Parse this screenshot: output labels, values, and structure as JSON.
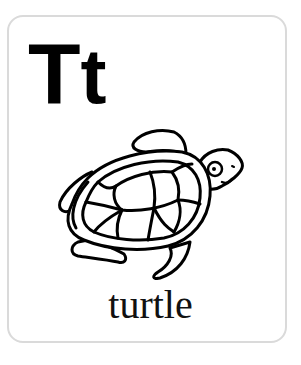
{
  "card": {
    "letters": {
      "uppercase": "T",
      "lowercase": "t"
    },
    "illustration": {
      "icon": "turtle-icon",
      "description": "line drawing of a sea turtle"
    },
    "word": "turtle"
  },
  "colors": {
    "background": "#ffffff",
    "card_border": "#dadada",
    "ink": "#000000"
  }
}
